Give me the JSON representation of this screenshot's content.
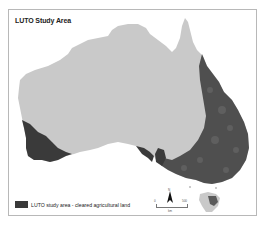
{
  "map": {
    "title": "LUTO Study Area",
    "region": "Australia",
    "colors": {
      "land": "#c9c9c9",
      "study_area": "#3a3a3a",
      "frame": "#b8b8b8",
      "background": "#ffffff"
    }
  },
  "legend": {
    "items": [
      {
        "label": "LUTO study area - cleared agricultural land",
        "color": "#3a3a3a"
      }
    ]
  },
  "north_arrow": {
    "label": "N"
  },
  "scale_bar": {
    "start": "0",
    "end": "500",
    "unit": "km"
  }
}
